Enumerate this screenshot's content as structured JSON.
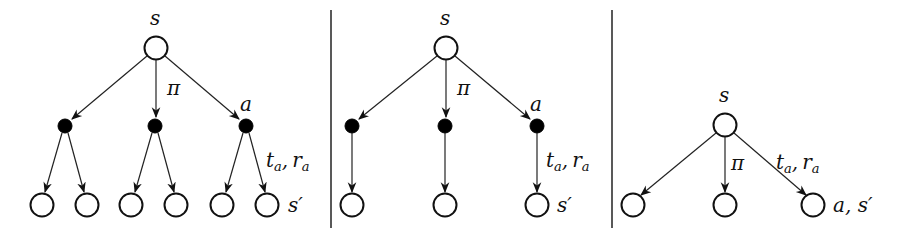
{
  "labels": {
    "state": "s",
    "policy": "π",
    "action": "a",
    "t": "t",
    "r": "r",
    "sub_a": "a",
    "comma": ",",
    "next_state": "s′",
    "action_next_state": "a, s′"
  },
  "panels": [
    {
      "name": "full-backup-tree",
      "root_label": "s",
      "edge_label": "π",
      "action_label": "a",
      "transition_label": "t_a, r_a",
      "leaf_label": "s′"
    },
    {
      "name": "deterministic-backup-tree",
      "root_label": "s",
      "edge_label": "π",
      "action_label": "a",
      "transition_label": "t_a, r_a",
      "leaf_label": "s′"
    },
    {
      "name": "collapsed-backup-tree",
      "root_label": "s",
      "edge_label": "π",
      "transition_label": "t_a, r_a",
      "leaf_label": "a, s′"
    }
  ]
}
